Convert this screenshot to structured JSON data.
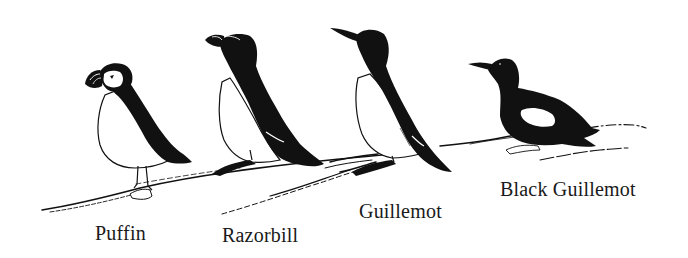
{
  "illustration": {
    "subject": "Auks perched on a rocky ledge",
    "colors": {
      "ink": "#111111",
      "paper": "#ffffff",
      "text": "#1a1a1a"
    },
    "birds": [
      {
        "id": "puffin",
        "label": "Puffin"
      },
      {
        "id": "razorbill",
        "label": "Razorbill"
      },
      {
        "id": "guillemot",
        "label": "Guillemot"
      },
      {
        "id": "black-guillemot",
        "label": "Black Guillemot"
      }
    ]
  }
}
